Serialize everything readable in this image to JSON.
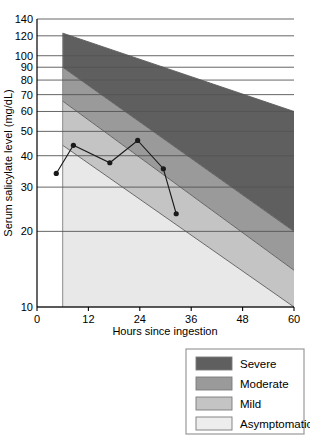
{
  "chart_data": {
    "type": "line",
    "title": "",
    "xlabel": "Hours since ingestion",
    "ylabel": "Serum salicylate level (mg/dL)",
    "xlim": [
      0,
      60
    ],
    "ylim": [
      10,
      140
    ],
    "yscale": "log",
    "grid": true,
    "xticks": [
      0,
      12,
      24,
      36,
      48,
      60
    ],
    "xtick_labels": [
      "0",
      "12",
      "24",
      "36",
      "48",
      "60"
    ],
    "yticks": [
      10,
      20,
      30,
      40,
      50,
      60,
      70,
      80,
      90,
      100,
      120,
      140
    ],
    "ytick_labels": [
      "10",
      "20",
      "30",
      "40",
      "50",
      "60",
      "70",
      "80",
      "90",
      "100",
      "120",
      "140"
    ],
    "legend_position": "below-right",
    "series": [
      {
        "name": "Patient salicylate measurements",
        "x": [
          4.5,
          8.5,
          17,
          23.5,
          29.5,
          32.5
        ],
        "values": [
          34,
          44,
          37.5,
          46,
          35.5,
          23.5
        ],
        "marker": "circle",
        "color": "#1a1a1a"
      }
    ],
    "bands": [
      {
        "name": "Severe",
        "color": "#5f5f5f",
        "x_start": 6,
        "x_end": 60,
        "upper_start": 123,
        "upper_end": 60,
        "lower_start": 90,
        "lower_end": 20
      },
      {
        "name": "Moderate",
        "color": "#9a9a9a",
        "x_start": 6,
        "x_end": 60,
        "upper_start": 90,
        "upper_end": 20,
        "lower_start": 66,
        "lower_end": 14
      },
      {
        "name": "Mild",
        "color": "#c4c4c4",
        "x_start": 6,
        "x_end": 60,
        "upper_start": 66,
        "upper_end": 14,
        "lower_start": 44,
        "lower_end": 10
      },
      {
        "name": "Asymptomatic",
        "color": "#e8e8e8",
        "x_start": 6,
        "x_end": 60,
        "upper_start": 44,
        "upper_end": 10,
        "lower_start": 10,
        "lower_end": 10
      }
    ]
  },
  "legend": {
    "items": [
      {
        "label": "Severe",
        "color": "#5f5f5f"
      },
      {
        "label": "Moderate",
        "color": "#9a9a9a"
      },
      {
        "label": "Mild",
        "color": "#c4c4c4"
      },
      {
        "label": "Asymptomatic",
        "color": "#ededed"
      }
    ]
  },
  "axes": {
    "x_label": "Hours since ingestion",
    "y_label": "Serum salicylate level (mg/dL)"
  },
  "colors": {
    "axis": "#000000",
    "grid": "#555555",
    "plot_line": "#1a1a1a",
    "band_edge": "#5a5a5a",
    "legend_border": "#9a9a9a"
  }
}
